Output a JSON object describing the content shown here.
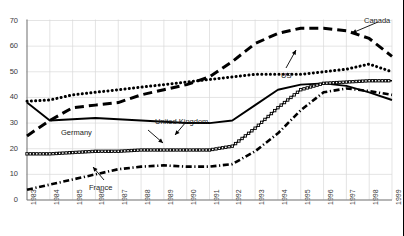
{
  "chart_data": {
    "type": "line",
    "title": "",
    "xlabel": "",
    "ylabel": "",
    "xlim": [
      1983,
      1999
    ],
    "ylim": [
      0,
      70
    ],
    "yticks": [
      0,
      10,
      20,
      30,
      40,
      50,
      60,
      70
    ],
    "grid": true,
    "legend_position": "inline-annotations",
    "x": [
      1983,
      1984,
      1985,
      1986,
      1987,
      1988,
      1989,
      1990,
      1991,
      1992,
      1993,
      1994,
      1995,
      1996,
      1997,
      1998,
      1999
    ],
    "series": [
      {
        "name": "Canada",
        "style": "dashed",
        "values": [
          25,
          31,
          36,
          37,
          38,
          41,
          43,
          45,
          48,
          54,
          61,
          65,
          67,
          67,
          66,
          63,
          56
        ]
      },
      {
        "name": "US",
        "style": "dotted",
        "values": [
          38.5,
          39,
          41,
          42,
          43,
          44,
          45,
          46,
          47,
          48,
          49,
          49,
          49,
          50,
          51,
          53,
          50
        ]
      },
      {
        "name": "United Kingdom",
        "style": "solid",
        "values": [
          38,
          31,
          31.5,
          32,
          31.5,
          31,
          30.5,
          30,
          30,
          31,
          37,
          43,
          45,
          45.5,
          44.5,
          42,
          39
        ]
      },
      {
        "name": "Germany",
        "style": "circle-chain",
        "values": [
          18,
          18,
          18.5,
          19,
          19,
          19.5,
          19.5,
          19.5,
          19.5,
          21,
          28,
          36,
          43,
          45.5,
          46,
          46.5,
          46.5
        ]
      },
      {
        "name": "France",
        "style": "dash-dot",
        "values": [
          4,
          6,
          8,
          10,
          12,
          13,
          13.5,
          13,
          13,
          14,
          19,
          26,
          35,
          42,
          43.5,
          42.5,
          41
        ]
      }
    ],
    "annotations": [
      {
        "label": "Canada",
        "x": 364,
        "y": 16,
        "arrow": true
      },
      {
        "label": "US",
        "x": 281,
        "y": 71,
        "arrow": true
      },
      {
        "label": "United Kingdom",
        "x": 155,
        "y": 117,
        "arrow": true
      },
      {
        "label": "Germany",
        "x": 61,
        "y": 128,
        "arrow": true
      },
      {
        "label": "France",
        "x": 89,
        "y": 183,
        "arrow": true
      }
    ]
  },
  "axes": {
    "y_labels": [
      "70",
      "60",
      "50",
      "40",
      "30",
      "20",
      "10",
      "0"
    ],
    "x_labels": [
      "1983",
      "1984",
      "1985",
      "1986",
      "1987",
      "1988",
      "1989",
      "1990",
      "1991",
      "1992",
      "1993",
      "1994",
      "1995",
      "1996",
      "1997",
      "1998",
      "1999"
    ]
  },
  "colors": {
    "line": "#000000",
    "grid": "#d9d9d9",
    "axis_text": "#3a3a3a",
    "background": "#ffffff"
  }
}
